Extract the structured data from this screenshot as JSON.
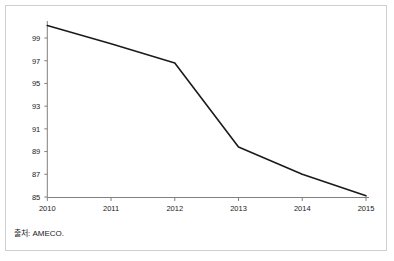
{
  "figure": {
    "top_clipped_text": "",
    "source_note": "출처: AMECO.",
    "background_color": "#ffffff",
    "frame_color": "#cfcfcf",
    "axis_color": "#808080",
    "line_color": "#1a1a1a"
  },
  "chart_data": {
    "type": "line",
    "title": "",
    "subtitle": "",
    "xlabel": "",
    "ylabel": "",
    "categories": [
      "2010",
      "2011",
      "2012",
      "2013",
      "2014",
      "2015"
    ],
    "x": [
      2010,
      2011,
      2012,
      2013,
      2014,
      2015
    ],
    "values": [
      100.1,
      98.5,
      96.8,
      89.4,
      87.0,
      85.1
    ],
    "series": [
      {
        "name": "",
        "values": [
          100.1,
          98.5,
          96.8,
          89.4,
          87.0,
          85.1
        ],
        "color": "#1a1a1a"
      }
    ],
    "xlim": [
      2010,
      2015
    ],
    "ylim": [
      85,
      100.6
    ],
    "ytick_labels": [
      "99",
      "97",
      "95",
      "93",
      "91",
      "89",
      "87",
      "85"
    ],
    "yticks": [
      99,
      97,
      95,
      93,
      91,
      89,
      87,
      85
    ],
    "xtick_labels": [
      "2010",
      "2011",
      "2012",
      "2013",
      "2014",
      "2015"
    ],
    "grid": false,
    "legend": false,
    "legend_position": "none",
    "annotations": [],
    "source": "출처: AMECO."
  }
}
